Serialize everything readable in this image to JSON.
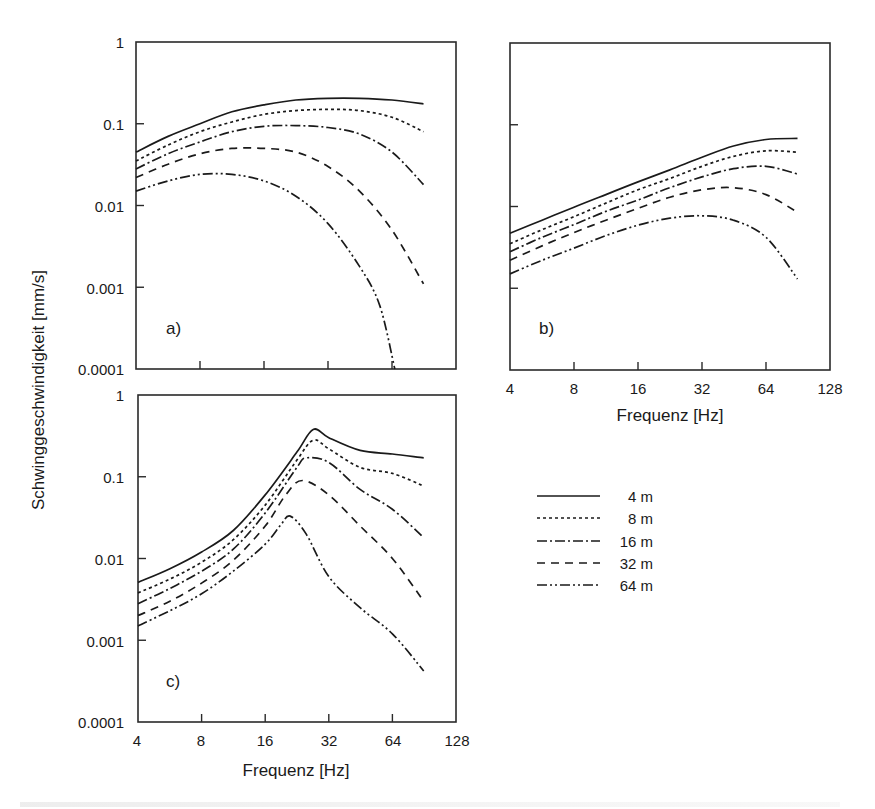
{
  "figure": {
    "y_axis_title": "Schwinggeschwindigkeit [mm/s]",
    "x_axis_title": "Frequenz [Hz]",
    "y_tick_labels": [
      "1",
      "0.1",
      "0.01",
      "0.001",
      "0.0001"
    ],
    "x_tick_labels": [
      "4",
      "8",
      "16",
      "32",
      "64",
      "128"
    ],
    "panels": [
      {
        "id": "a",
        "label": "a)"
      },
      {
        "id": "b",
        "label": "b)"
      },
      {
        "id": "c",
        "label": "c)"
      }
    ],
    "legend": [
      {
        "label": "4 m",
        "style": "solid"
      },
      {
        "label": "8 m",
        "style": "dotted"
      },
      {
        "label": "16 m",
        "style": "dash-dot"
      },
      {
        "label": "32 m",
        "style": "dashed"
      },
      {
        "label": "64 m",
        "style": "dash-dot-dot"
      }
    ]
  },
  "chart_data": [
    {
      "type": "line",
      "title": "a)",
      "xlabel": "Frequenz [Hz]",
      "ylabel": "Schwinggeschwindigkeit [mm/s]",
      "xscale": "log2",
      "yscale": "log10",
      "xlim": [
        4,
        128
      ],
      "ylim": [
        0.0001,
        1
      ],
      "x_ticks": [
        4,
        8,
        16,
        32,
        64,
        128
      ],
      "y_ticks": [
        0.0001,
        0.001,
        0.01,
        0.1,
        1
      ],
      "grid": false,
      "series": [
        {
          "name": "4 m",
          "x": [
            4,
            5.66,
            8,
            11.3,
            16,
            22.6,
            32,
            45,
            64,
            90
          ],
          "values": [
            0.045,
            0.07,
            0.1,
            0.14,
            0.17,
            0.195,
            0.205,
            0.205,
            0.195,
            0.175
          ]
        },
        {
          "name": "8 m",
          "x": [
            4,
            5.66,
            8,
            11.3,
            16,
            22.6,
            32,
            45,
            64,
            90
          ],
          "values": [
            0.035,
            0.055,
            0.08,
            0.105,
            0.13,
            0.145,
            0.15,
            0.145,
            0.12,
            0.08
          ]
        },
        {
          "name": "16 m",
          "x": [
            4,
            5.66,
            8,
            11.3,
            16,
            22.6,
            32,
            45,
            64,
            90
          ],
          "values": [
            0.028,
            0.043,
            0.06,
            0.08,
            0.093,
            0.095,
            0.09,
            0.075,
            0.045,
            0.018
          ]
        },
        {
          "name": "32 m",
          "x": [
            4,
            5.66,
            8,
            11.3,
            16,
            22.6,
            32,
            45,
            64,
            90
          ],
          "values": [
            0.022,
            0.032,
            0.043,
            0.05,
            0.05,
            0.045,
            0.03,
            0.015,
            0.005,
            0.0011
          ]
        },
        {
          "name": "64 m",
          "x": [
            4,
            5.66,
            8,
            11.3,
            16,
            22.6,
            32,
            45,
            56,
            66
          ],
          "values": [
            0.015,
            0.02,
            0.024,
            0.024,
            0.02,
            0.013,
            0.006,
            0.0018,
            0.0006,
            0.0001
          ]
        }
      ]
    },
    {
      "type": "line",
      "title": "b)",
      "xlabel": "Frequenz [Hz]",
      "ylabel": "Schwinggeschwindigkeit [mm/s]",
      "xscale": "log2",
      "yscale": "log10",
      "xlim": [
        4,
        128
      ],
      "ylim": [
        0.0001,
        1
      ],
      "x_ticks": [
        4,
        8,
        16,
        32,
        64,
        128
      ],
      "grid": false,
      "series": [
        {
          "name": "4 m",
          "x": [
            4,
            5.66,
            8,
            11.3,
            16,
            22.6,
            32,
            45,
            64,
            90
          ],
          "values": [
            0.0047,
            0.0068,
            0.0098,
            0.014,
            0.02,
            0.028,
            0.04,
            0.055,
            0.066,
            0.068
          ]
        },
        {
          "name": "8 m",
          "x": [
            4,
            5.66,
            8,
            11.3,
            16,
            22.6,
            32,
            45,
            64,
            90
          ],
          "values": [
            0.0035,
            0.0052,
            0.0075,
            0.011,
            0.016,
            0.022,
            0.031,
            0.041,
            0.048,
            0.046
          ]
        },
        {
          "name": "16 m",
          "x": [
            4,
            5.66,
            8,
            11.3,
            16,
            22.6,
            32,
            45,
            64,
            90
          ],
          "values": [
            0.0028,
            0.0042,
            0.006,
            0.0087,
            0.012,
            0.017,
            0.023,
            0.029,
            0.031,
            0.025
          ]
        },
        {
          "name": "32 m",
          "x": [
            4,
            5.66,
            8,
            11.3,
            16,
            22.6,
            32,
            45,
            64,
            90
          ],
          "values": [
            0.0022,
            0.0033,
            0.0048,
            0.0068,
            0.0095,
            0.013,
            0.016,
            0.017,
            0.014,
            0.0085
          ]
        },
        {
          "name": "64 m",
          "x": [
            4,
            5.66,
            8,
            11.3,
            16,
            22.6,
            32,
            45,
            64,
            90
          ],
          "values": [
            0.0015,
            0.0022,
            0.0031,
            0.0044,
            0.0059,
            0.0072,
            0.0077,
            0.0068,
            0.0042,
            0.0013
          ]
        }
      ]
    },
    {
      "type": "line",
      "title": "c)",
      "xlabel": "Frequenz [Hz]",
      "ylabel": "Schwinggeschwindigkeit [mm/s]",
      "xscale": "log2",
      "yscale": "log10",
      "xlim": [
        4,
        128
      ],
      "ylim": [
        0.0001,
        1
      ],
      "x_ticks": [
        4,
        8,
        16,
        32,
        64,
        128
      ],
      "y_ticks": [
        0.0001,
        0.001,
        0.01,
        0.1,
        1
      ],
      "grid": false,
      "series": [
        {
          "name": "4 m",
          "x": [
            4,
            5.66,
            8,
            11.3,
            16,
            22.6,
            27,
            32,
            45,
            64,
            90
          ],
          "values": [
            0.0051,
            0.0075,
            0.012,
            0.022,
            0.06,
            0.2,
            0.38,
            0.3,
            0.21,
            0.19,
            0.17
          ]
        },
        {
          "name": "8 m",
          "x": [
            4,
            5.66,
            8,
            11.3,
            16,
            22.6,
            27,
            32,
            45,
            64,
            90
          ],
          "values": [
            0.0038,
            0.0056,
            0.009,
            0.017,
            0.045,
            0.16,
            0.28,
            0.22,
            0.13,
            0.11,
            0.077
          ]
        },
        {
          "name": "16 m",
          "x": [
            4,
            5.66,
            8,
            11.3,
            16,
            22.6,
            25,
            32,
            45,
            64,
            90
          ],
          "values": [
            0.0028,
            0.0043,
            0.007,
            0.013,
            0.036,
            0.13,
            0.17,
            0.15,
            0.07,
            0.04,
            0.018
          ]
        },
        {
          "name": "32 m",
          "x": [
            4,
            5.66,
            8,
            11.3,
            16,
            20,
            24,
            32,
            45,
            64,
            90
          ],
          "values": [
            0.002,
            0.003,
            0.005,
            0.0095,
            0.025,
            0.06,
            0.09,
            0.06,
            0.025,
            0.01,
            0.003
          ]
        },
        {
          "name": "64 m",
          "x": [
            4,
            5.66,
            8,
            11.3,
            16,
            19,
            21,
            25,
            32,
            45,
            64,
            90
          ],
          "values": [
            0.0015,
            0.0023,
            0.0037,
            0.007,
            0.015,
            0.026,
            0.033,
            0.02,
            0.006,
            0.0025,
            0.0012,
            0.00042
          ]
        }
      ]
    }
  ]
}
